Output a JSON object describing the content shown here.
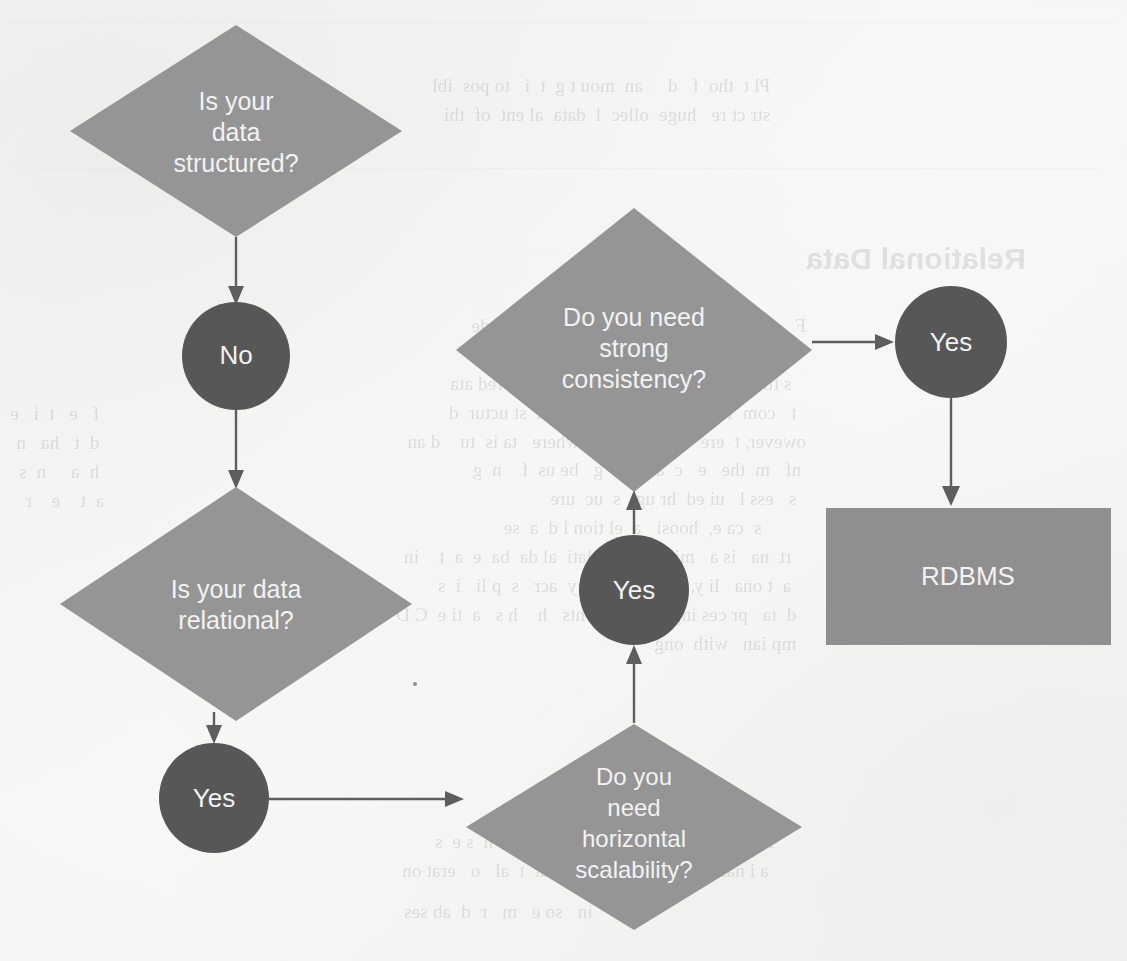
{
  "diagram": {
    "colors": {
      "diamond_fill": "#959595",
      "circle_fill": "#575757",
      "box_fill": "#8f8f8f",
      "label_text": "#f2f2f2",
      "edge_stroke": "#5e5e5e",
      "page_background": "#fdfdfc"
    },
    "nodes": [
      {
        "id": "q-structured",
        "shape": "diamond",
        "lines": [
          "Is your",
          "data",
          "structured?"
        ],
        "cx": 236,
        "cy": 131,
        "rx": 166,
        "ry": 106
      },
      {
        "id": "a-no",
        "shape": "circle",
        "lines": [
          "No"
        ],
        "cx": 236,
        "cy": 356,
        "r": 54
      },
      {
        "id": "q-relational",
        "shape": "diamond",
        "lines": [
          "Is your data",
          "relational?"
        ],
        "cx": 236,
        "cy": 604,
        "rx": 176,
        "ry": 117
      },
      {
        "id": "a-yes-relational",
        "shape": "circle",
        "lines": [
          "Yes"
        ],
        "cx": 214,
        "cy": 798,
        "r": 55
      },
      {
        "id": "q-horizontal",
        "shape": "diamond",
        "lines": [
          "Do you",
          "need",
          "horizontal",
          "scalability?"
        ],
        "cx": 634,
        "cy": 827,
        "rx": 168,
        "ry": 103
      },
      {
        "id": "a-yes-horizontal",
        "shape": "circle",
        "lines": [
          "Yes"
        ],
        "cx": 634,
        "cy": 590,
        "r": 55
      },
      {
        "id": "q-consistency",
        "shape": "diamond",
        "lines": [
          "Do you need",
          "strong",
          "consistency?"
        ],
        "cx": 634,
        "cy": 350,
        "rx": 178,
        "ry": 142
      },
      {
        "id": "a-yes-consistency",
        "shape": "circle",
        "lines": [
          "Yes"
        ],
        "cx": 951,
        "cy": 342,
        "r": 56
      },
      {
        "id": "result-rdbms",
        "shape": "rect",
        "lines": [
          "RDBMS"
        ],
        "x": 826,
        "y": 508,
        "w": 285,
        "h": 137
      }
    ],
    "edges": [
      {
        "id": "edge-structured-to-no",
        "from": "q-structured",
        "to": "a-no",
        "direction": "down"
      },
      {
        "id": "edge-no-to-relational",
        "from": "a-no",
        "to": "q-relational",
        "direction": "down"
      },
      {
        "id": "edge-relational-to-yes",
        "from": "q-relational",
        "to": "a-yes-relational",
        "direction": "down"
      },
      {
        "id": "edge-yes-to-horizontal",
        "from": "a-yes-relational",
        "to": "q-horizontal",
        "direction": "right"
      },
      {
        "id": "edge-horizontal-to-yes",
        "from": "q-horizontal",
        "to": "a-yes-horizontal",
        "direction": "up"
      },
      {
        "id": "edge-yes-to-consistency",
        "from": "a-yes-horizontal",
        "to": "q-consistency",
        "direction": "up"
      },
      {
        "id": "edge-consistency-to-yes",
        "from": "q-consistency",
        "to": "a-yes-consistency",
        "direction": "right"
      },
      {
        "id": "edge-yes-to-rdbms",
        "from": "a-yes-consistency",
        "to": "result-rdbms",
        "direction": "down"
      }
    ]
  },
  "background_page": {
    "description": "Faint mirrored bleed-through text from the reverse side of a scanned book page",
    "heading": "Relational Data",
    "blocks": [
      {
        "x": 432,
        "y": 72,
        "size": 19,
        "text": "Pl t  tho  f   d     an  mou t g  t  i   to pos  ibl\nstr ct re   huge  ollec  l  data  al ent  of  thi"
      },
      {
        "x": 806,
        "y": 236,
        "size": 30,
        "head": true,
        "text": "Relational Data"
      },
      {
        "x": 396,
        "y": 312,
        "size": 19,
        "text": "F     ome   er   ur      h  t    th e  dat     mode\n  at  st       f  e   i  al   a   t  e     re a  ti n\n   s tu  bl  mo  un  n  c   l  u  ions  tru    red ata\n  t   com  les  an  wh  the  is  fferen  st uctur  d\nowever, t  ere    e    iro  ents  where   ta is  tu    d an\n nf   m  the   e   c  a   l   s  g   be us  f    n  g\n  s   ess l   ui ed  hr ug   s  uc  ure\n         s  ca e,  hoosi   a  el tion l d  a  se\n   rt  na   is a   mi  ble    a relati  al da  ba  e  a  t    in\n   a  t ona   li y, d ta  onsi  ency  acr   s  p li   i  s\n  d  ta   pr ces ing  mon  ele  nts   h    h s   a  ti e  C D\n  mp ian   with  ong"
      },
      {
        "x": 402,
        "y": 828,
        "size": 19,
        "text": "  is    p p    f  r  rel  ional    ta ase  s    h  s e  s\n   a i nal   fa  re  a  s  p    ed   eat  t  al   o   erat on"
      },
      {
        "x": 404,
        "y": 898,
        "size": 19,
        "text": "   in   so e   m   r  d  ab ses"
      }
    ]
  }
}
